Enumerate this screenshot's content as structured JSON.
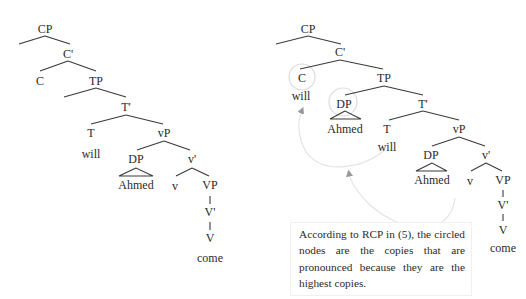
{
  "left_tree": {
    "nodes": {
      "cp": "CP",
      "cbar": "C'",
      "c": "C",
      "tp": "TP",
      "tbar": "T'",
      "t": "T",
      "t_word": "will",
      "vp_small": "vP",
      "dp": "DP",
      "dp_word": "Ahmed",
      "vbar_small": "v'",
      "v_small": "v",
      "vp": "VP",
      "vbar": "V'",
      "v": "V",
      "v_word": "come"
    }
  },
  "right_tree": {
    "nodes": {
      "cp": "CP",
      "cbar": "C'",
      "c": "C",
      "c_word": "will",
      "tp": "TP",
      "dp_high": "DP",
      "dp_high_word": "Ahmed",
      "tbar": "T'",
      "t": "T",
      "t_word": "will",
      "vp_small": "vP",
      "dp_low": "DP",
      "dp_low_word": "Ahmed",
      "vbar_small": "v'",
      "v_small": "v",
      "vp": "VP",
      "vbar": "V'",
      "v": "V",
      "v_word": "come"
    },
    "circled_nodes": [
      "C",
      "DP"
    ],
    "movement_arrows": [
      {
        "from": "T will",
        "to": "C will"
      },
      {
        "from": "DP Ahmed (vP spec)",
        "to": "DP Ahmed (TP spec)"
      }
    ]
  },
  "note": {
    "text": "According to RCP in (5), the circled nodes are the copies that are pronounced because they are the highest copies."
  }
}
